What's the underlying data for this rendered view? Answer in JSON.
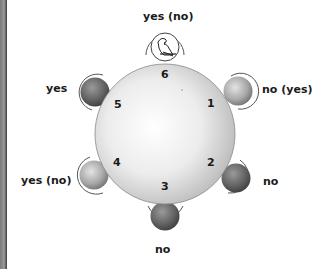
{
  "diagram": {
    "title": "",
    "table": {
      "shape": "round",
      "seat_count": 6
    },
    "seats": [
      {
        "number": "1",
        "label": "no (yes)",
        "tone": "light"
      },
      {
        "number": "2",
        "label": "no",
        "tone": "dark"
      },
      {
        "number": "3",
        "label": "no",
        "tone": "dark"
      },
      {
        "number": "4",
        "label": "yes (no)",
        "tone": "light"
      },
      {
        "number": "5",
        "label": "yes",
        "tone": "dark"
      },
      {
        "number": "6",
        "label": "yes (no)",
        "tone": "bird-icon"
      }
    ]
  },
  "colors": {
    "table_fill_center": "#ffffff",
    "table_fill_edge": "#bdbdbd",
    "seat_dark": "#5e5e5e",
    "seat_light": "#a8a8a8",
    "ring": "#555555",
    "text": "#1a1a1a",
    "left_bar": "#7a7a7a"
  }
}
